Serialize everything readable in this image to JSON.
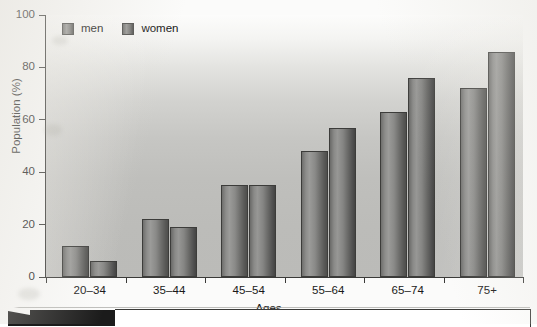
{
  "chart_data": {
    "type": "bar",
    "title": "",
    "xlabel": "Ages",
    "ylabel": "Population (%)",
    "categories": [
      "20–34",
      "35–44",
      "45–54",
      "55–64",
      "65–74",
      "75+"
    ],
    "series": [
      {
        "name": "men",
        "values": [
          12,
          22,
          35,
          48,
          63,
          72
        ]
      },
      {
        "name": "women",
        "values": [
          6,
          19,
          35,
          57,
          76,
          86
        ]
      }
    ],
    "ylim": [
      0,
      100
    ],
    "yticks": [
      0,
      20,
      40,
      60,
      80,
      100
    ],
    "ytick_labels": [
      "0",
      "20",
      "40",
      "60",
      "80",
      "100"
    ],
    "grid": false,
    "legend_position": "top-left",
    "legend_entries": [
      "men",
      "women"
    ]
  },
  "axes": {
    "y_title": "Population (%)",
    "x_title": "Ages"
  },
  "legend": {
    "items": [
      {
        "label": "men",
        "swatch": "men-swatch-icon"
      },
      {
        "label": "women",
        "swatch": "women-swatch-icon"
      }
    ]
  },
  "colors": {
    "bar_men": "#8a8a88",
    "bar_women": "#7b7b79",
    "axis": "#3a3a38",
    "plot_background_top": "#fcfcfb",
    "plot_background_bottom": "#bbbbb8",
    "page_background": "#fbfbfa",
    "bottom_tab": "#1b1b1b"
  }
}
